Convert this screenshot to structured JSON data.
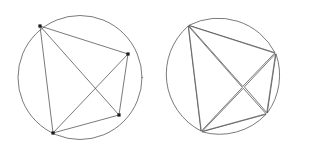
{
  "figure": {
    "caption": "",
    "background_color": "#ffffff",
    "stroke_color": "#4d4d4d",
    "vertex_color": "#1a1a1a",
    "stroke_width": 0.75,
    "panel_count": 2
  },
  "chart_data": {
    "type": "diagram",
    "xlabel": "",
    "ylabel": "",
    "xlim": [
      0,
      315
    ],
    "ylim": [
      0,
      154
    ],
    "grid": false,
    "legend": null,
    "panels": [
      {
        "name": "assembled-circle",
        "label": "",
        "circle": {
          "cx": 80,
          "cy": 77.5,
          "r": 62
        },
        "points": [
          {
            "id": "A",
            "x": 40,
            "y": 26
          },
          {
            "id": "B",
            "x": 128,
            "y": 54
          },
          {
            "id": "C",
            "x": 119,
            "y": 115
          },
          {
            "id": "D",
            "x": 53,
            "y": 133
          }
        ],
        "chords": [
          {
            "from": "A",
            "to": "B"
          },
          {
            "from": "A",
            "to": "C"
          },
          {
            "from": "A",
            "to": "D"
          },
          {
            "from": "B",
            "to": "C"
          },
          {
            "from": "B",
            "to": "D"
          },
          {
            "from": "C",
            "to": "D"
          }
        ],
        "interior_crossings": [
          {
            "chords": [
              "A-C",
              "B-D"
            ],
            "x": 94,
            "y": 84
          }
        ],
        "region_count": 8,
        "vertex_marker": "square",
        "vertex_marker_size": 3.2
      },
      {
        "name": "exploded-circle",
        "label": "",
        "circle": {
          "cx": 228,
          "cy": 77,
          "r": 64
        },
        "points": [
          {
            "id": "A",
            "x": 188,
            "y": 25
          },
          {
            "id": "B",
            "x": 276,
            "y": 53
          },
          {
            "id": "C",
            "x": 267,
            "y": 114
          },
          {
            "id": "D",
            "x": 201,
            "y": 132
          }
        ],
        "chords": [
          {
            "from": "A",
            "to": "B"
          },
          {
            "from": "A",
            "to": "C"
          },
          {
            "from": "A",
            "to": "D"
          },
          {
            "from": "B",
            "to": "C"
          },
          {
            "from": "B",
            "to": "D"
          },
          {
            "from": "C",
            "to": "D"
          }
        ],
        "interior_crossings": [
          {
            "chords": [
              "A-C",
              "B-D"
            ],
            "x": 242,
            "y": 84
          }
        ],
        "region_count": 8,
        "exploded": true,
        "gap": 2.6,
        "vertex_marker": "none"
      }
    ]
  }
}
